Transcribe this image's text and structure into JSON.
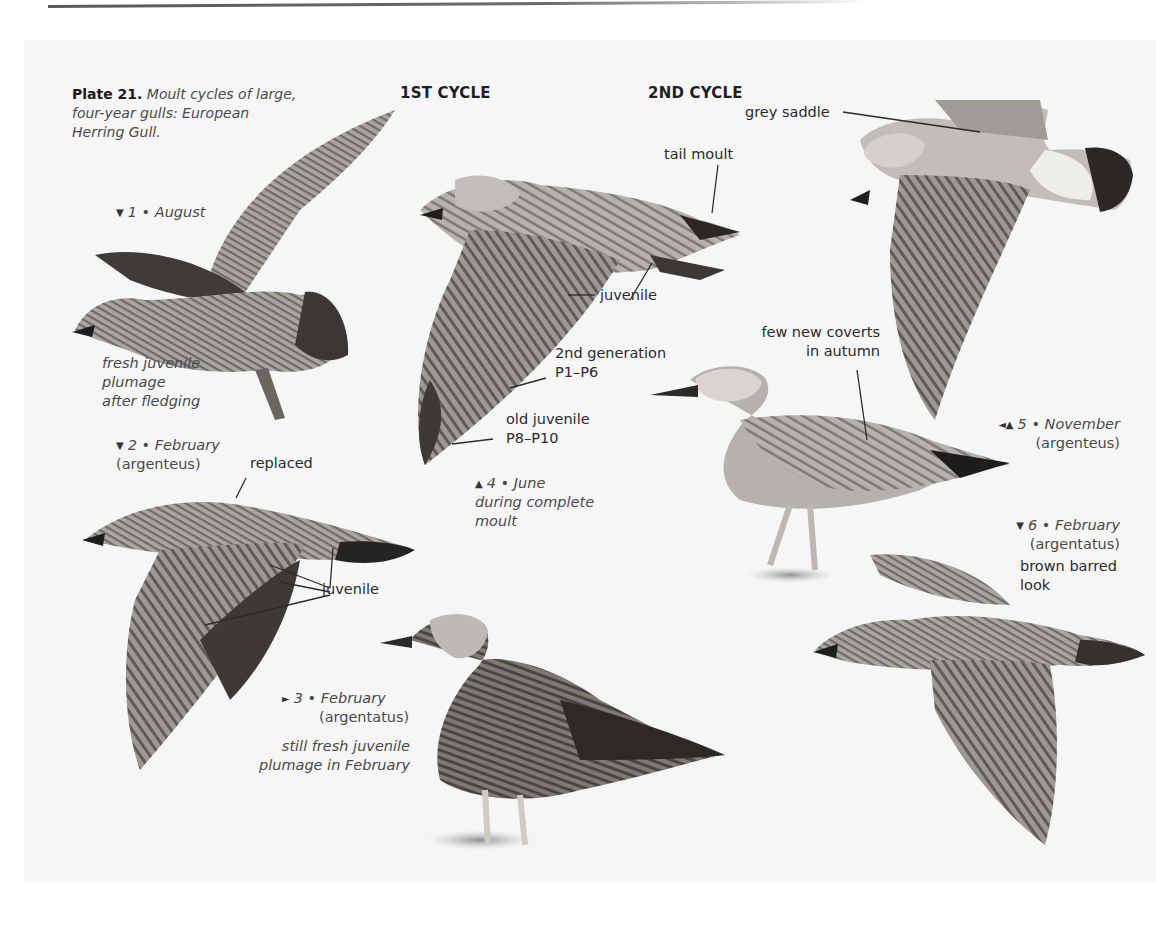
{
  "page": {
    "plate_label": "Plate 21.",
    "plate_caption": "Moult cycles of large, four-year gulls: European Herring Gull.",
    "plate_caption_lines": [
      "Moult cycles of large,",
      "four-year gulls: European",
      "Herring Gull."
    ],
    "columns": [
      {
        "label": "1ST CYCLE"
      },
      {
        "label": "2ND CYCLE"
      }
    ]
  },
  "figures": [
    {
      "number": "1",
      "marker": "▼",
      "month": "August",
      "form": "",
      "notes": [
        "fresh juvenile",
        "plumage",
        "after fledging"
      ]
    },
    {
      "number": "2",
      "marker": "▼",
      "month": "February",
      "form": "(argenteus)",
      "callouts": [
        "replaced",
        "juvenile"
      ]
    },
    {
      "number": "3",
      "marker": "►",
      "month": "February",
      "form": "(argentatus)",
      "notes": [
        "still fresh juvenile",
        "plumage in February"
      ]
    },
    {
      "number": "4",
      "marker": "▲",
      "month": "June",
      "notes": [
        "during complete",
        "moult"
      ],
      "callouts": [
        "tail moult",
        "juvenile",
        "2nd generation",
        "P1–P6",
        "old juvenile",
        "P8–P10"
      ]
    },
    {
      "number": "5",
      "marker": "◄▲",
      "month": "November",
      "form": "(argenteus)",
      "callouts": [
        "few new coverts",
        "in autumn"
      ]
    },
    {
      "number": "6",
      "marker": "▼",
      "month": "February",
      "form": "(argentatus)",
      "notes": [
        "brown barred",
        "look"
      ]
    }
  ],
  "callouts_top_right": {
    "grey_saddle": "grey saddle"
  },
  "separator": "•"
}
